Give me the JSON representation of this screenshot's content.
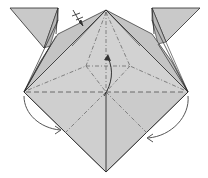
{
  "diagram": {
    "type": "origami-fold-diagram",
    "description": "Origami step: square-based model with two ear flaps; valley and mountain fold lines, fold arrows",
    "colors": {
      "background": "#ffffff",
      "paper": "#d0d0d0",
      "paper_dark": "#c2c2c2",
      "flap": "#c8c8c8",
      "edge": "#2a2a2a",
      "crease": "#6a6a6a",
      "arrow": "#555555"
    },
    "symbols": {
      "pleat_mark": "x-on-line",
      "center_arrow": "curved-arrow-up",
      "left_arrow": "curved-arrow-down-right",
      "right_arrow": "curved-arrow-down-left"
    },
    "lines": {
      "valley": "dashed",
      "mountain": "dash-dot"
    }
  }
}
